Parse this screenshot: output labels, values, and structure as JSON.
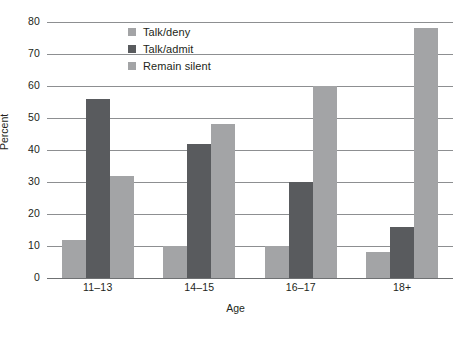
{
  "chart_data": {
    "type": "bar",
    "title": "",
    "xlabel": "Age",
    "ylabel": "Percent",
    "categories": [
      "11–13",
      "14–15",
      "16–17",
      "18+"
    ],
    "series": [
      {
        "name": "Talk/deny",
        "color": "#a3a4a6",
        "values": [
          12,
          10,
          10,
          8
        ]
      },
      {
        "name": "Talk/admit",
        "color": "#595b5e",
        "values": [
          56,
          42,
          30,
          16
        ]
      },
      {
        "name": "Remain silent",
        "color": "#a3a4a6",
        "values": [
          32,
          48,
          60,
          78
        ]
      }
    ],
    "ylim": [
      0,
      80
    ],
    "yticks": [
      80,
      70,
      60,
      50,
      40,
      30,
      20,
      10,
      0
    ],
    "grid": true,
    "legend_position": "top-center"
  },
  "axes": {
    "y_title": "Percent",
    "x_title": "Age",
    "y_tick_labels": [
      "80",
      "70",
      "60",
      "50",
      "40",
      "30",
      "20",
      "10",
      "0"
    ],
    "x_tick_labels": [
      "11–13",
      "14–15",
      "16–17",
      "18+"
    ]
  },
  "legend": {
    "items": [
      {
        "label": "Talk/deny"
      },
      {
        "label": "Talk/admit"
      },
      {
        "label": "Remain silent"
      }
    ]
  },
  "colors": {
    "series_light": "#a3a4a6",
    "series_dark": "#595b5e",
    "gridline": "#8d8f91",
    "text": "#231f20",
    "background": "#ffffff"
  }
}
